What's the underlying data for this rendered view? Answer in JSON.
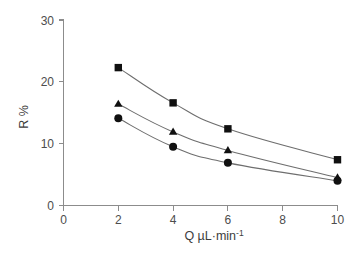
{
  "chart_data": {
    "type": "line",
    "title": "",
    "subtitle": "",
    "xlabel": "Q  µL·min",
    "xlabel_sup": "-1",
    "ylabel": "R %",
    "xlim": [
      0,
      10
    ],
    "ylim": [
      0,
      30
    ],
    "grid": false,
    "legend": "none",
    "x_ticks": [
      0,
      2,
      4,
      6,
      8,
      10
    ],
    "x_tick_labels": [
      "0",
      "2",
      "4",
      "6",
      "8",
      "10"
    ],
    "y_ticks": [
      0,
      10,
      20,
      30
    ],
    "y_tick_labels": [
      "0",
      "10",
      "20",
      "30"
    ],
    "x": [
      2,
      4,
      6,
      10
    ],
    "series": [
      {
        "name": "series-square",
        "marker": "square",
        "color": "#101010",
        "values": [
          22.3,
          16.6,
          12.4,
          7.4
        ]
      },
      {
        "name": "series-triangle",
        "marker": "triangle",
        "color": "#101010",
        "values": [
          16.4,
          11.9,
          8.9,
          4.5
        ]
      },
      {
        "name": "series-circle",
        "marker": "circle",
        "color": "#101010",
        "values": [
          14.1,
          9.5,
          6.9,
          4.0
        ]
      }
    ]
  },
  "axes": {
    "y_title": "R %",
    "x_title_main": "Q  µL·min",
    "x_title_sup": "-1"
  },
  "colors": {
    "axis": "#8c8c8c",
    "line": "#6e6e6e",
    "marker": "#101010",
    "tick_text": "#4d4d4d",
    "background": "#ffffff"
  }
}
